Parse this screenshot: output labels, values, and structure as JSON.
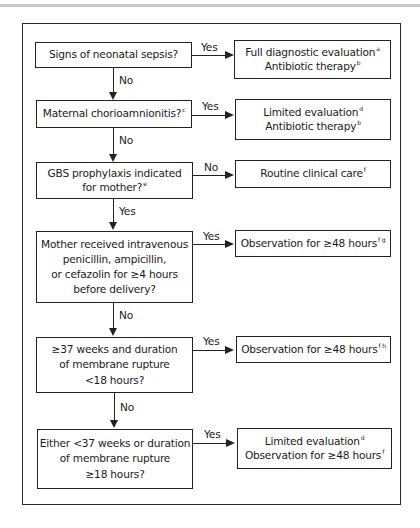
{
  "flowchart": {
    "decisions": [
      {
        "lines": [
          "Signs of neonatal sepsis?"
        ],
        "sup": ""
      },
      {
        "lines": [
          "Maternal chorioamnionitis?"
        ],
        "sup": "c"
      },
      {
        "lines": [
          "GBS prophylaxis indicated",
          "for mother?"
        ],
        "sup": "e"
      },
      {
        "lines": [
          "Mother received intravenous",
          "penicillin, ampicillin,",
          "or cefazolin for ≥4 hours",
          "before delivery?"
        ],
        "sup": ""
      },
      {
        "lines": [
          "≥37 weeks and duration",
          "of membrane rupture",
          "<18 hours?"
        ],
        "sup": ""
      },
      {
        "lines": [
          "Either <37 weeks or duration",
          "of membrane rupture",
          "≥18 hours?"
        ],
        "sup": ""
      }
    ],
    "outcomes": [
      {
        "line1": "Full diagnostic evaluation",
        "sup1": "a",
        "line2": "Antibiotic therapy",
        "sup2": "b"
      },
      {
        "line1": "Limited evaluation",
        "sup1": "d",
        "line2": "Antibiotic therapy",
        "sup2": "b"
      },
      {
        "line1": "Routine clinical care",
        "sup1": "f"
      },
      {
        "line1": "Observation for ≥48 hours",
        "sup1": "f g"
      },
      {
        "line1": "Observation for ≥48 hours",
        "sup1": "f h"
      },
      {
        "line1": "Limited evaluation",
        "sup1": "d",
        "line2": "Observation for ≥48 hours",
        "sup2": "f"
      }
    ],
    "edge_labels": {
      "d1_yes": "Yes",
      "d1_no": "No",
      "d2_yes": "Yes",
      "d2_no": "No",
      "d3_no": "No",
      "d3_yes": "Yes",
      "d4_yes": "Yes",
      "d4_no": "No",
      "d5_yes": "Yes",
      "d5_no": "No",
      "d6_yes": "Yes"
    }
  }
}
